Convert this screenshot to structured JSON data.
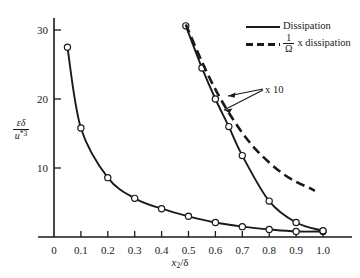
{
  "figure": {
    "background_color": "#ffffff",
    "line_color": "#1a1a1a",
    "marker_fill": "#ffffff"
  },
  "axes": {
    "x_label_text": "x2/δ",
    "x_label_main": "x",
    "x_label_sub": "2",
    "x_label_tail": "/δ",
    "y_label_numerator": "εδ",
    "y_label_denominator": "u",
    "y_label_denominator_sup": "*3",
    "x_ticks": [
      "0",
      "0.1",
      "0.2",
      "0.3",
      "0.4",
      "0.5",
      "0.6",
      "0.7",
      "0.8",
      "0.9",
      "1.0"
    ],
    "y_ticks": [
      "10",
      "20",
      "30"
    ]
  },
  "legend": {
    "position": "top-right",
    "entries": [
      {
        "label": "Dissipation",
        "style": "solid",
        "prefix": "",
        "frac_num": "",
        "frac_den": ""
      },
      {
        "label": "x dissipation",
        "style": "dashed",
        "prefix": "",
        "frac_num": "1",
        "frac_den": "Ω"
      }
    ]
  },
  "annotations": [
    {
      "name": "x10-multiplier",
      "text": "x 10"
    }
  ],
  "chart_data": {
    "type": "line",
    "title": "",
    "subtitle": "",
    "xlabel": "x2/δ",
    "ylabel": "εδ/u*3",
    "xlim": [
      0,
      1.05
    ],
    "ylim": [
      0,
      33
    ],
    "grid": false,
    "legend_position": "top-right",
    "x_ticks": [
      0,
      0.1,
      0.2,
      0.3,
      0.4,
      0.5,
      0.6,
      0.7,
      0.8,
      0.9,
      1.0
    ],
    "y_ticks": [
      10,
      20,
      30
    ],
    "series": [
      {
        "name": "Dissipation",
        "style": "solid",
        "markers": true,
        "scale_note": "",
        "x": [
          0.05,
          0.1,
          0.2,
          0.3,
          0.4,
          0.5,
          0.6,
          0.7,
          0.8,
          0.9,
          1.0
        ],
        "y": [
          27.5,
          15.8,
          8.6,
          5.6,
          4.1,
          3.0,
          2.1,
          1.5,
          1.1,
          0.8,
          0.8
        ]
      },
      {
        "name": "Dissipation x 10",
        "style": "solid",
        "markers": true,
        "scale_note": "x 10",
        "x": [
          0.49,
          0.55,
          0.6,
          0.65,
          0.7,
          0.8,
          0.9,
          1.0
        ],
        "y": [
          30.6,
          24.5,
          20.0,
          16.0,
          11.8,
          5.2,
          2.1,
          0.9
        ]
      },
      {
        "name": "1/Ω x dissipation x 10",
        "style": "dashed",
        "markers": false,
        "scale_note": "x 10",
        "x": [
          0.49,
          0.55,
          0.6,
          0.65,
          0.7,
          0.75,
          0.8,
          0.85,
          0.9,
          0.95,
          0.97
        ],
        "y": [
          30.8,
          25.4,
          21.4,
          18.0,
          15.1,
          12.7,
          10.8,
          9.2,
          8.0,
          7.1,
          6.7
        ]
      }
    ]
  }
}
